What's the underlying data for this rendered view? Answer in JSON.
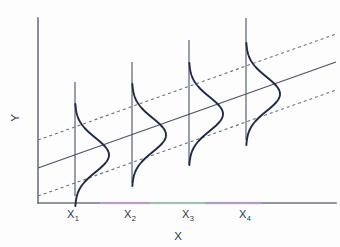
{
  "figure": {
    "kind": "regression-normal-distributions-diagram",
    "background_color": "#fdfdfd",
    "axes": {
      "x_title": "X",
      "y_title": "Y",
      "axis_color": "#6b7280",
      "origin_px": [
        38,
        203
      ],
      "x_axis_end_px": [
        336,
        203
      ],
      "y_axis_top_px": [
        38,
        18
      ],
      "tint_colors": [
        "#d9a8e8",
        "#a8e8c0",
        "#c9a0e0"
      ]
    },
    "tick_labels": [
      {
        "base": "X",
        "sub": "1",
        "x_px": 73
      },
      {
        "base": "X",
        "sub": "2",
        "x_px": 130
      },
      {
        "base": "X",
        "sub": "3",
        "x_px": 188
      },
      {
        "base": "X",
        "sub": "4",
        "x_px": 245
      }
    ],
    "curve_color": "#1f2a4a",
    "stem_color": "#3f4a6b"
  },
  "chart_data": {
    "type": "line",
    "title": "",
    "subtitle": "",
    "xlabel": "X",
    "ylabel": "Y",
    "grid": false,
    "legend": "none",
    "xlim": [
      0,
      1
    ],
    "ylim": [
      0,
      1
    ],
    "categories": [
      "X1",
      "X2",
      "X3",
      "X4"
    ],
    "tick_text": [
      "X₁",
      "X₂",
      "X₃",
      "X₄"
    ],
    "series": [
      {
        "name": "population regression line",
        "style": "solid",
        "x": [
          38,
          336
        ],
        "y_px": [
          168,
          62
        ],
        "values": [
          0.19,
          0.76
        ]
      },
      {
        "name": "upper parallel band",
        "style": "dashed",
        "x": [
          38,
          336
        ],
        "y_px": [
          140,
          34
        ],
        "values": [
          0.34,
          0.91
        ]
      },
      {
        "name": "lower parallel band",
        "style": "dashed",
        "x": [
          38,
          336
        ],
        "y_px": [
          196,
          90
        ],
        "values": [
          0.04,
          0.61
        ]
      }
    ],
    "distributions": [
      {
        "label": "X₁",
        "x_px": 75,
        "mean_y_px": 155,
        "stem_top_px": 82,
        "stem_bottom_px": 196,
        "amplitude_px": 34,
        "sigma_px": 17
      },
      {
        "label": "X₂",
        "x_px": 132,
        "mean_y_px": 135,
        "stem_top_px": 62,
        "stem_bottom_px": 183,
        "amplitude_px": 34,
        "sigma_px": 17
      },
      {
        "label": "X₃",
        "x_px": 189,
        "mean_y_px": 114,
        "stem_top_px": 40,
        "stem_bottom_px": 165,
        "amplitude_px": 34,
        "sigma_px": 17
      },
      {
        "label": "X₄",
        "x_px": 246,
        "mean_y_px": 94,
        "stem_top_px": 18,
        "stem_bottom_px": 140,
        "amplitude_px": 34,
        "sigma_px": 17
      }
    ]
  }
}
